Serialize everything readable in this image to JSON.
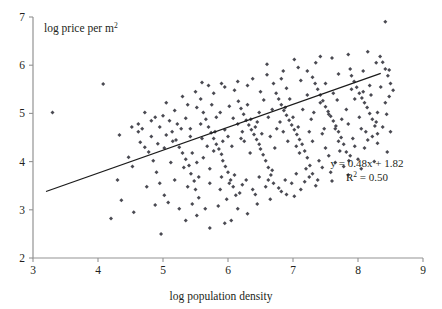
{
  "chart_data": {
    "type": "scatter",
    "title": "",
    "xlabel": "log population density",
    "ylabel": "log price per m2",
    "ylabel_display": "log price per m",
    "ylabel_sup": "2",
    "xlim": [
      3,
      9
    ],
    "ylim": [
      2,
      7
    ],
    "xticks": [
      3,
      4,
      5,
      6,
      7,
      8,
      9
    ],
    "yticks": [
      2,
      3,
      4,
      5,
      6,
      7
    ],
    "xtick_labels": [
      "3",
      "4",
      "5",
      "6",
      "7",
      "8",
      "9"
    ],
    "ytick_labels": [
      "2",
      "3",
      "4",
      "5",
      "6",
      "7"
    ],
    "grid": false,
    "legend": "none",
    "marker_color": "#4a4a52",
    "line_color": "#1b1b1b",
    "axis_color": "#939393",
    "annotations": {
      "equation": "y = 0.48x + 1.82",
      "r_squared_prefix": "R",
      "r_squared_sup": "2",
      "r_squared_value": " = 0.50",
      "slope": 0.48,
      "intercept": 1.82,
      "r_squared": 0.5
    },
    "fit_line": {
      "x_start": 3.2,
      "y_start": 3.38,
      "x_end": 8.35,
      "y_end": 5.83
    },
    "points": [
      [
        3.3,
        5.02
      ],
      [
        4.08,
        5.61
      ],
      [
        4.62,
        4.78
      ],
      [
        4.47,
        4.09
      ],
      [
        4.72,
        4.3
      ],
      [
        4.92,
        4.37
      ],
      [
        4.53,
        3.9
      ],
      [
        4.3,
        3.62
      ],
      [
        4.36,
        3.2
      ],
      [
        4.2,
        2.82
      ],
      [
        4.55,
        2.95
      ],
      [
        4.33,
        4.55
      ],
      [
        4.62,
        4.62
      ],
      [
        4.78,
        4.2
      ],
      [
        4.85,
        4.02
      ],
      [
        4.9,
        3.78
      ],
      [
        4.95,
        3.55
      ],
      [
        5.02,
        3.3
      ],
      [
        5.1,
        4.85
      ],
      [
        5.14,
        4.62
      ],
      [
        5.2,
        4.45
      ],
      [
        5.25,
        4.3
      ],
      [
        5.3,
        4.18
      ],
      [
        5.35,
        4.05
      ],
      [
        5.4,
        3.92
      ],
      [
        5.43,
        3.75
      ],
      [
        5.48,
        3.6
      ],
      [
        5.5,
        3.42
      ],
      [
        5.55,
        3.25
      ],
      [
        4.97,
        2.5
      ],
      [
        5.62,
        5.02
      ],
      [
        5.66,
        4.88
      ],
      [
        5.7,
        4.72
      ],
      [
        5.74,
        4.6
      ],
      [
        5.78,
        4.48
      ],
      [
        5.82,
        4.36
      ],
      [
        5.86,
        4.26
      ],
      [
        5.9,
        4.15
      ],
      [
        5.92,
        4.02
      ],
      [
        5.96,
        3.9
      ],
      [
        6.0,
        3.78
      ],
      [
        6.04,
        3.62
      ],
      [
        6.08,
        3.48
      ],
      [
        6.12,
        3.3
      ],
      [
        5.6,
        5.64
      ],
      [
        6.16,
        5.25
      ],
      [
        6.2,
        5.1
      ],
      [
        6.24,
        4.98
      ],
      [
        6.28,
        4.86
      ],
      [
        6.32,
        4.76
      ],
      [
        6.36,
        4.66
      ],
      [
        6.4,
        4.56
      ],
      [
        6.44,
        4.46
      ],
      [
        6.48,
        4.36
      ],
      [
        6.5,
        4.26
      ],
      [
        6.54,
        4.14
      ],
      [
        6.58,
        4.02
      ],
      [
        6.62,
        3.88
      ],
      [
        6.66,
        3.72
      ],
      [
        6.7,
        3.55
      ],
      [
        6.74,
        5.42
      ],
      [
        6.78,
        5.3
      ],
      [
        6.82,
        5.18
      ],
      [
        6.86,
        5.06
      ],
      [
        6.9,
        4.96
      ],
      [
        6.94,
        4.86
      ],
      [
        6.98,
        4.76
      ],
      [
        7.02,
        4.66
      ],
      [
        7.06,
        4.56
      ],
      [
        7.1,
        4.46
      ],
      [
        7.14,
        4.36
      ],
      [
        7.18,
        4.22
      ],
      [
        7.22,
        4.08
      ],
      [
        7.26,
        3.92
      ],
      [
        7.3,
        3.75
      ],
      [
        7.34,
        5.62
      ],
      [
        7.38,
        5.5
      ],
      [
        7.42,
        5.38
      ],
      [
        7.46,
        5.26
      ],
      [
        7.5,
        5.14
      ],
      [
        7.54,
        5.04
      ],
      [
        7.58,
        4.94
      ],
      [
        7.62,
        4.84
      ],
      [
        7.66,
        4.74
      ],
      [
        7.7,
        4.62
      ],
      [
        7.74,
        4.5
      ],
      [
        7.78,
        4.36
      ],
      [
        7.82,
        4.2
      ],
      [
        7.86,
        4.02
      ],
      [
        7.9,
        5.78
      ],
      [
        7.94,
        5.66
      ],
      [
        7.98,
        5.54
      ],
      [
        8.02,
        5.42
      ],
      [
        8.06,
        5.32
      ],
      [
        8.1,
        5.22
      ],
      [
        8.14,
        5.12
      ],
      [
        8.18,
        5.0
      ],
      [
        8.22,
        4.88
      ],
      [
        8.26,
        4.74
      ],
      [
        8.3,
        4.58
      ],
      [
        8.34,
        6.18
      ],
      [
        8.38,
        6.06
      ],
      [
        8.42,
        5.92
      ],
      [
        8.46,
        5.78
      ],
      [
        8.5,
        5.62
      ],
      [
        8.54,
        5.48
      ],
      [
        8.42,
        6.9
      ],
      [
        8.15,
        6.28
      ],
      [
        7.85,
        6.22
      ],
      [
        7.6,
        6.15
      ],
      [
        7.35,
        6.05
      ],
      [
        7.08,
        5.95
      ],
      [
        6.85,
        5.88
      ],
      [
        6.6,
        5.8
      ],
      [
        6.38,
        5.72
      ],
      [
        6.15,
        5.66
      ],
      [
        5.95,
        5.55
      ],
      [
        5.78,
        5.42
      ],
      [
        5.58,
        5.3
      ],
      [
        5.38,
        5.18
      ],
      [
        5.18,
        5.06
      ],
      [
        5.0,
        4.95
      ],
      [
        4.82,
        4.85
      ],
      [
        4.68,
        4.68
      ],
      [
        5.72,
        2.62
      ],
      [
        6.3,
        2.92
      ],
      [
        6.05,
        2.78
      ],
      [
        5.85,
        3.08
      ],
      [
        6.45,
        3.12
      ],
      [
        6.65,
        3.22
      ],
      [
        6.9,
        3.32
      ],
      [
        7.12,
        3.42
      ],
      [
        7.35,
        3.5
      ],
      [
        7.6,
        3.6
      ],
      [
        7.85,
        3.72
      ],
      [
        8.05,
        3.85
      ],
      [
        8.25,
        4.0
      ],
      [
        8.45,
        4.2
      ],
      [
        5.05,
        4.55
      ],
      [
        5.15,
        4.42
      ],
      [
        5.28,
        4.68
      ],
      [
        5.42,
        4.52
      ],
      [
        5.58,
        4.78
      ],
      [
        5.68,
        4.32
      ],
      [
        5.82,
        4.92
      ],
      [
        5.95,
        4.66
      ],
      [
        6.08,
        4.9
      ],
      [
        6.22,
        4.62
      ],
      [
        6.35,
        4.88
      ],
      [
        6.48,
        5.02
      ],
      [
        6.62,
        4.92
      ],
      [
        6.75,
        4.68
      ],
      [
        6.88,
        5.12
      ],
      [
        7.0,
        4.92
      ],
      [
        7.15,
        5.08
      ],
      [
        7.28,
        4.88
      ],
      [
        7.42,
        5.22
      ],
      [
        7.55,
        4.98
      ],
      [
        7.68,
        5.28
      ],
      [
        7.82,
        5.08
      ],
      [
        7.95,
        5.3
      ],
      [
        8.08,
        5.45
      ],
      [
        8.2,
        5.38
      ],
      [
        8.35,
        5.55
      ],
      [
        8.48,
        5.35
      ],
      [
        5.12,
        3.98
      ],
      [
        5.32,
        3.88
      ],
      [
        5.52,
        3.98
      ],
      [
        5.72,
        3.85
      ],
      [
        5.9,
        3.68
      ],
      [
        6.1,
        3.72
      ],
      [
        6.28,
        3.62
      ],
      [
        6.48,
        3.68
      ],
      [
        6.68,
        3.82
      ],
      [
        6.88,
        3.62
      ],
      [
        7.05,
        3.75
      ],
      [
        7.25,
        3.68
      ],
      [
        7.45,
        3.88
      ],
      [
        7.65,
        3.98
      ],
      [
        7.88,
        4.12
      ],
      [
        8.1,
        4.28
      ],
      [
        8.3,
        4.38
      ],
      [
        8.5,
        4.62
      ],
      [
        4.75,
        3.48
      ],
      [
        4.88,
        3.1
      ],
      [
        5.08,
        3.15
      ],
      [
        5.25,
        3.02
      ],
      [
        5.45,
        3.12
      ],
      [
        5.65,
        3.02
      ],
      [
        5.98,
        3.22
      ],
      [
        6.18,
        3.35
      ],
      [
        6.38,
        3.42
      ],
      [
        6.58,
        3.48
      ],
      [
        6.78,
        3.45
      ],
      [
        6.98,
        3.55
      ],
      [
        7.18,
        3.58
      ],
      [
        7.38,
        3.62
      ],
      [
        7.58,
        3.78
      ],
      [
        7.78,
        3.9
      ],
      [
        8.0,
        4.05
      ],
      [
        4.65,
        4.4
      ],
      [
        4.95,
        4.72
      ],
      [
        5.35,
        4.9
      ],
      [
        5.52,
        5.12
      ],
      [
        5.75,
        5.18
      ],
      [
        5.88,
        5.02
      ],
      [
        6.02,
        5.15
      ],
      [
        6.15,
        4.78
      ],
      [
        6.3,
        5.18
      ],
      [
        6.42,
        4.72
      ],
      [
        6.55,
        5.28
      ],
      [
        6.68,
        5.08
      ],
      [
        6.8,
        4.82
      ],
      [
        6.95,
        5.3
      ],
      [
        7.08,
        4.72
      ],
      [
        7.22,
        5.38
      ],
      [
        7.32,
        5.02
      ],
      [
        7.48,
        4.68
      ],
      [
        7.62,
        5.42
      ],
      [
        7.75,
        4.88
      ],
      [
        7.9,
        5.5
      ],
      [
        8.02,
        4.92
      ],
      [
        8.18,
        5.58
      ],
      [
        8.3,
        5.02
      ],
      [
        8.42,
        5.22
      ],
      [
        5.45,
        4.18
      ],
      [
        5.62,
        4.08
      ],
      [
        5.78,
        4.22
      ],
      [
        5.92,
        4.42
      ],
      [
        6.06,
        4.32
      ],
      [
        6.2,
        4.48
      ],
      [
        6.34,
        4.18
      ],
      [
        6.52,
        4.58
      ],
      [
        6.72,
        4.28
      ],
      [
        6.92,
        4.42
      ],
      [
        7.1,
        4.18
      ],
      [
        7.3,
        4.42
      ],
      [
        7.5,
        4.28
      ],
      [
        7.7,
        4.42
      ],
      [
        7.92,
        4.48
      ],
      [
        8.12,
        4.62
      ],
      [
        8.28,
        4.82
      ],
      [
        8.44,
        4.98
      ],
      [
        4.52,
        4.72
      ],
      [
        4.82,
        4.52
      ],
      [
        5.02,
        4.28
      ],
      [
        5.22,
        4.78
      ],
      [
        5.42,
        4.68
      ],
      [
        5.6,
        4.48
      ],
      [
        5.8,
        4.62
      ],
      [
        6.0,
        4.52
      ],
      [
        6.25,
        4.42
      ],
      [
        6.45,
        4.82
      ],
      [
        6.65,
        4.52
      ],
      [
        6.85,
        4.62
      ],
      [
        7.05,
        4.32
      ],
      [
        7.25,
        4.62
      ],
      [
        7.45,
        4.58
      ],
      [
        7.65,
        4.68
      ],
      [
        7.85,
        4.78
      ],
      [
        8.05,
        4.68
      ],
      [
        8.22,
        4.52
      ],
      [
        8.38,
        4.72
      ],
      [
        5.18,
        3.62
      ],
      [
        5.38,
        3.48
      ],
      [
        5.55,
        3.68
      ],
      [
        5.72,
        3.55
      ],
      [
        5.88,
        3.42
      ],
      [
        6.02,
        3.55
      ],
      [
        6.22,
        3.52
      ],
      [
        6.42,
        3.32
      ],
      [
        6.62,
        3.62
      ],
      [
        6.82,
        3.38
      ],
      [
        7.02,
        3.28
      ],
      [
        7.2,
        3.85
      ],
      [
        7.4,
        4.02
      ],
      [
        7.55,
        4.12
      ],
      [
        7.72,
        4.22
      ],
      [
        7.95,
        4.32
      ],
      [
        8.15,
        4.45
      ],
      [
        5.3,
        5.35
      ],
      [
        5.5,
        5.45
      ],
      [
        5.7,
        5.58
      ],
      [
        5.9,
        5.62
      ],
      [
        6.1,
        5.48
      ],
      [
        6.3,
        5.58
      ],
      [
        6.5,
        5.45
      ],
      [
        6.7,
        5.62
      ],
      [
        6.9,
        5.52
      ],
      [
        7.12,
        5.68
      ],
      [
        7.3,
        5.75
      ],
      [
        7.5,
        5.62
      ],
      [
        7.7,
        5.82
      ],
      [
        7.88,
        5.92
      ],
      [
        8.08,
        5.88
      ],
      [
        8.28,
        6.05
      ],
      [
        8.48,
        5.9
      ],
      [
        5.05,
        5.22
      ],
      [
        4.88,
        4.92
      ],
      [
        4.72,
        5.02
      ],
      [
        6.6,
        6.02
      ],
      [
        6.82,
        5.72
      ],
      [
        7.02,
        6.12
      ],
      [
        7.22,
        5.88
      ],
      [
        7.42,
        6.18
      ],
      [
        5.95,
        2.72
      ],
      [
        6.15,
        3.02
      ],
      [
        5.52,
        2.88
      ],
      [
        5.35,
        2.78
      ]
    ]
  }
}
